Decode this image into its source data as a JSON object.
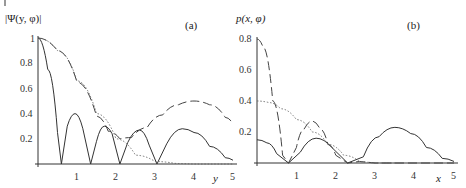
{
  "chart_data": [
    {
      "type": "line",
      "panel_label": "(a)",
      "ylabel": "|Ψ(y, φ)|",
      "xlabel": "y",
      "xlim": [
        0,
        5
      ],
      "ylim": [
        0,
        1
      ],
      "xticks": [
        "1",
        "2",
        "3",
        "4",
        "5"
      ],
      "yticks": [
        "0.2",
        "0.4",
        "0.6",
        "0.8",
        "1"
      ],
      "grid": false,
      "series": [
        {
          "name": "solid",
          "style": "solid",
          "x": [
            0,
            0.25,
            0.5,
            0.6,
            0.75,
            0.95,
            1.15,
            1.35,
            1.5,
            1.7,
            1.9,
            2.1,
            2.3,
            2.6,
            2.85,
            3.05,
            3.3,
            3.7,
            4.0,
            4.4,
            4.8,
            5.0
          ],
          "y": [
            1,
            0.75,
            0.25,
            0,
            0.3,
            0.4,
            0.28,
            0,
            0.18,
            0.3,
            0.24,
            0,
            0.17,
            0.27,
            0.15,
            0,
            0.16,
            0.28,
            0.25,
            0.14,
            0.05,
            0.03
          ]
        },
        {
          "name": "dashed",
          "style": "dashed",
          "x": [
            0,
            0.5,
            1.0,
            1.5,
            1.8,
            2.1,
            2.4,
            2.8,
            3.2,
            3.6,
            4.0,
            4.4,
            4.8,
            5.0
          ],
          "y": [
            1,
            0.9,
            0.65,
            0.38,
            0.26,
            0.2,
            0.21,
            0.29,
            0.39,
            0.47,
            0.5,
            0.47,
            0.37,
            0.32
          ]
        },
        {
          "name": "dotted",
          "style": "dotted",
          "x": [
            0,
            0.5,
            1.0,
            1.5,
            2.0,
            2.5,
            3.0,
            3.5,
            4.0,
            5.0
          ],
          "y": [
            1,
            0.9,
            0.66,
            0.4,
            0.2,
            0.07,
            0.02,
            0.005,
            0,
            0
          ]
        }
      ]
    },
    {
      "type": "line",
      "panel_label": "(b)",
      "ylabel": "p(x, φ)",
      "xlabel": "x",
      "xlim": [
        0,
        5
      ],
      "ylim": [
        0,
        0.8
      ],
      "xticks": [
        "1",
        "2",
        "3",
        "4",
        "5"
      ],
      "yticks": [
        "0.2",
        "0.4",
        "0.6",
        "0.8"
      ],
      "grid": false,
      "series": [
        {
          "name": "solid",
          "style": "solid",
          "x": [
            0,
            0.25,
            0.5,
            0.8,
            1.1,
            1.5,
            1.9,
            2.3,
            2.7,
            3.1,
            3.5,
            3.9,
            4.3,
            4.7,
            5.0
          ],
          "y": [
            0.15,
            0.13,
            0.06,
            0,
            0.07,
            0.16,
            0.1,
            0,
            0.04,
            0.17,
            0.23,
            0.19,
            0.1,
            0.03,
            0.01
          ]
        },
        {
          "name": "dashed",
          "style": "dashed",
          "x": [
            0,
            0.15,
            0.4,
            0.65,
            0.8,
            1.0,
            1.2,
            1.4,
            1.6,
            1.8,
            2.0,
            2.3,
            2.6,
            3.0,
            5.0
          ],
          "y": [
            0.8,
            0.75,
            0.4,
            0.05,
            0,
            0.1,
            0.22,
            0.27,
            0.22,
            0.12,
            0.05,
            0,
            0.01,
            0,
            0
          ]
        },
        {
          "name": "dotted",
          "style": "dotted",
          "x": [
            0,
            0.3,
            0.6,
            1.0,
            1.4,
            1.8,
            2.2,
            2.6,
            3.0,
            3.5
          ],
          "y": [
            0.4,
            0.39,
            0.35,
            0.28,
            0.2,
            0.12,
            0.05,
            0.01,
            0,
            0
          ]
        }
      ]
    }
  ]
}
